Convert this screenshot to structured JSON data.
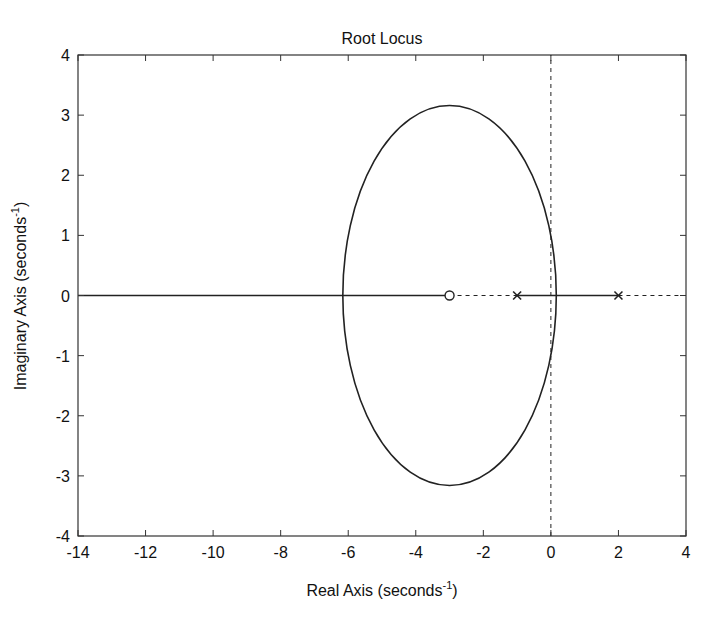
{
  "chart_data": {
    "type": "line",
    "title": "Root Locus",
    "xlabel": "Real Axis (seconds",
    "xlabel_sup": "-1",
    "xlabel_end": ")",
    "ylabel": "Imaginary Axis (seconds",
    "ylabel_sup": "-1",
    "ylabel_end": ")",
    "xlim": [
      -14,
      4
    ],
    "ylim": [
      -4,
      4
    ],
    "xticks": [
      -14,
      -12,
      -10,
      -8,
      -6,
      -4,
      -2,
      0,
      2,
      4
    ],
    "yticks": [
      -4,
      -3,
      -2,
      -1,
      0,
      1,
      2,
      3,
      4
    ],
    "grid": false,
    "poles": [
      [
        -1,
        0
      ],
      [
        2,
        0
      ]
    ],
    "zeros": [
      [
        -3,
        0
      ]
    ],
    "series": [
      {
        "name": "locus-real-left",
        "x": [
          -14,
          -3
        ],
        "y": [
          0,
          0
        ],
        "style": "solid"
      },
      {
        "name": "locus-real-middle",
        "x": [
          -1,
          2
        ],
        "y": [
          0,
          0
        ],
        "style": "solid"
      },
      {
        "name": "locus-circle",
        "center": [
          -3,
          0
        ],
        "rx": 3.16,
        "ry": 3.16,
        "style": "solid"
      },
      {
        "name": "real-axis-dashed",
        "x": [
          -3,
          -1
        ],
        "y": [
          0,
          0
        ],
        "style": "dashed"
      },
      {
        "name": "real-axis-dashed-right",
        "x": [
          2,
          4
        ],
        "y": [
          0,
          0
        ],
        "style": "dashed"
      },
      {
        "name": "imag-axis-dashed",
        "x": [
          0,
          0
        ],
        "y": [
          -4,
          4
        ],
        "style": "dashed"
      }
    ]
  }
}
